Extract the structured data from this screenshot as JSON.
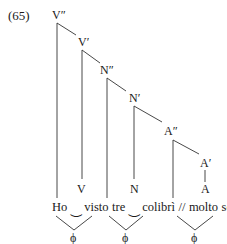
{
  "example_number": "(65)",
  "nodes": {
    "v2": "V″",
    "v1": "V′",
    "n2": "N″",
    "n1": "N′",
    "a2": "A″",
    "a1": "A′",
    "a0": "A",
    "v0": "V",
    "n0": "N"
  },
  "words": {
    "ho": "Ho",
    "liaison1": "‿",
    "visto": "visto",
    "tre": "tre",
    "liaison2": "‿",
    "colibri": "colibrì",
    "boundary": "//",
    "molto": "molto",
    "scuri": "scuri"
  },
  "phrases": [
    "ϕ",
    "ϕ",
    "ϕ"
  ]
}
